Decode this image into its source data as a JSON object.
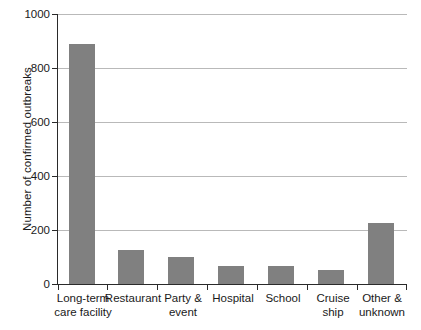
{
  "chart_data": {
    "type": "bar",
    "title": "",
    "xlabel": "",
    "ylabel": "Number of confirmed outbreaks",
    "ylim": [
      0,
      1000
    ],
    "ytick_labels": [
      "0",
      "200",
      "400",
      "600",
      "800",
      "1000"
    ],
    "ytick_values": [
      0,
      200,
      400,
      600,
      800,
      1000
    ],
    "grid": "horizontal",
    "legend": "none",
    "bar_color": "#808080",
    "categories": [
      "Long-term\ncare facility",
      "Restaurant",
      "Party &\nevent",
      "Hospital",
      "School",
      "Cruise\nship",
      "Other &\nunknown"
    ],
    "values": [
      889,
      126,
      100,
      67,
      67,
      52,
      226
    ]
  }
}
